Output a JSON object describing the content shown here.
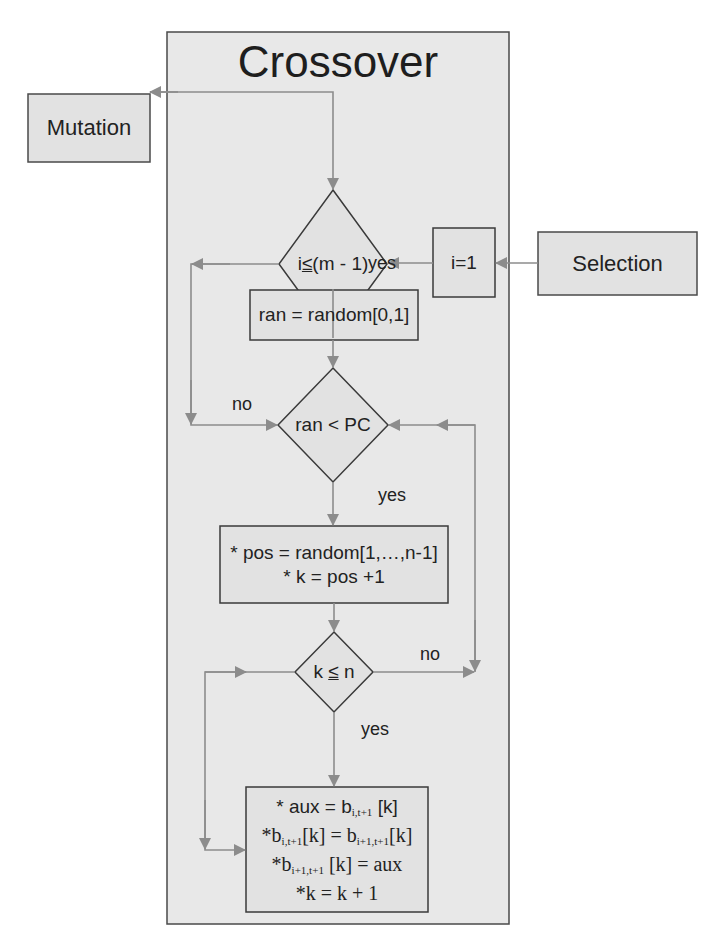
{
  "title": "Crossover",
  "external_nodes": {
    "mutation": "Mutation",
    "selection": "Selection"
  },
  "nodes": {
    "init": "i=1",
    "cond_outer": {
      "left": "i",
      "op": "≤",
      "right": " (m - 1)"
    },
    "random_draw": "ran = random[0,1]",
    "cond_pc": "ran < PC",
    "position": {
      "line1": "* pos = random[1,…,n-1]",
      "line2": "* k = pos +1"
    },
    "cond_k": {
      "left": "k",
      "op": "≤",
      "right": "n"
    },
    "swap": {
      "line1": {
        "prefix": "* aux = b",
        "sub": "i,t+1",
        "suffix": " [k]"
      },
      "line2": {
        "prefix": "*b",
        "sub1": "i,t+1",
        "mid": "[k] = b",
        "sub2": "i+1,t+1",
        "suffix": "[k]"
      },
      "line3": {
        "prefix": "*b",
        "sub": "i+1,t+1",
        "suffix": " [k] = aux"
      },
      "line4": "*k = k + 1"
    }
  },
  "edge_labels": {
    "yes_1": "yes",
    "no_1": "no",
    "yes_2": "yes",
    "no_2": "no",
    "yes_3": "yes"
  },
  "colors": {
    "frame_fill": "#e8e8e8",
    "box_fill": "#e2e2e2",
    "border": "#3a3a3a",
    "arrow": "#8c8c8c"
  }
}
